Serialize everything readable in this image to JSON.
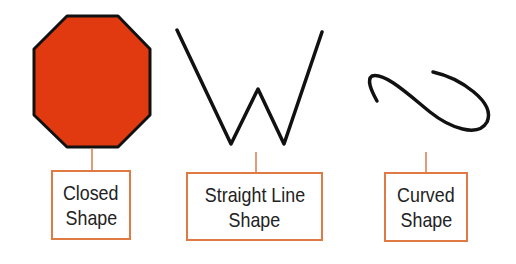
{
  "colors": {
    "octagon_fill": "#e23a10",
    "stroke": "#111111",
    "label_border": "#e07a45",
    "connector": "#d97a4a"
  },
  "shapes": [
    {
      "name": "closed-shape",
      "type": "octagon",
      "label_line1": "Closed",
      "label_line2": "Shape"
    },
    {
      "name": "straight-line-shape",
      "type": "zigzag-W",
      "label_line1": "Straight Line",
      "label_line2": "Shape"
    },
    {
      "name": "curved-shape",
      "type": "curve",
      "label_line1": "Curved",
      "label_line2": "Shape"
    }
  ]
}
